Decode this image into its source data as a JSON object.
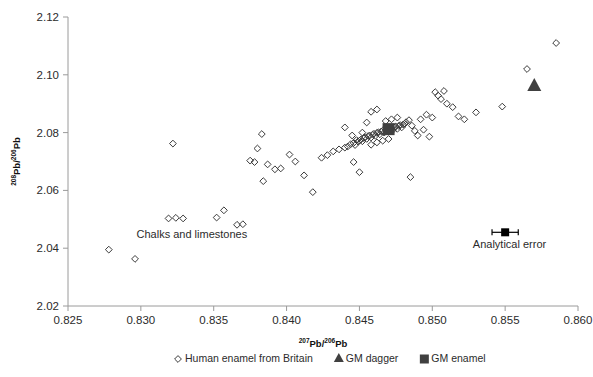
{
  "chart_data": {
    "type": "scatter",
    "title": "",
    "xlabel": "207Pb/206Pb",
    "ylabel": "208Pb/206Pb",
    "xlabel_parts": {
      "sup": "207",
      "base": "Pb/",
      "sup2": "206",
      "base2": "Pb"
    },
    "ylabel_parts": {
      "sup": "208",
      "base": "Pb/",
      "sup2": "206",
      "base2": "Pb"
    },
    "xlim": [
      0.825,
      0.86
    ],
    "ylim": [
      2.02,
      2.12
    ],
    "xticks": [
      "0.825",
      "0.830",
      "0.835",
      "0.840",
      "0.845",
      "0.850",
      "0.855",
      "0.860"
    ],
    "yticks": [
      "2.02",
      "2.04",
      "2.06",
      "2.08",
      "2.10",
      "2.12"
    ],
    "grid": false,
    "legend_position": "bottom",
    "series": [
      {
        "name": "Human enamel from Britain",
        "marker": "open-diamond",
        "color": "#3a3a3a",
        "points": [
          [
            0.8278,
            2.0395
          ],
          [
            0.8296,
            2.0363
          ],
          [
            0.8319,
            2.0503
          ],
          [
            0.8324,
            2.0505
          ],
          [
            0.8329,
            2.0503
          ],
          [
            0.8322,
            2.0762
          ],
          [
            0.8352,
            2.0506
          ],
          [
            0.8357,
            2.0531
          ],
          [
            0.8366,
            2.0481
          ],
          [
            0.837,
            2.0483
          ],
          [
            0.8375,
            2.0703
          ],
          [
            0.8378,
            2.0698
          ],
          [
            0.838,
            2.0745
          ],
          [
            0.8383,
            2.0795
          ],
          [
            0.8384,
            2.0632
          ],
          [
            0.8387,
            2.069
          ],
          [
            0.8392,
            2.0673
          ],
          [
            0.8396,
            2.0676
          ],
          [
            0.8402,
            2.0724
          ],
          [
            0.8406,
            2.07
          ],
          [
            0.8412,
            2.0652
          ],
          [
            0.8418,
            2.0594
          ],
          [
            0.8424,
            2.0713
          ],
          [
            0.8428,
            2.0722
          ],
          [
            0.8432,
            2.0735
          ],
          [
            0.8436,
            2.0742
          ],
          [
            0.844,
            2.0748
          ],
          [
            0.8442,
            2.0752
          ],
          [
            0.8444,
            2.076
          ],
          [
            0.8446,
            2.0764
          ],
          [
            0.8447,
            2.0757
          ],
          [
            0.8449,
            2.0769
          ],
          [
            0.845,
            2.0772
          ],
          [
            0.8451,
            2.0776
          ],
          [
            0.8452,
            2.077
          ],
          [
            0.8453,
            2.0781
          ],
          [
            0.8454,
            2.0784
          ],
          [
            0.8455,
            2.0778
          ],
          [
            0.8456,
            2.0788
          ],
          [
            0.8457,
            2.079
          ],
          [
            0.8458,
            2.0783
          ],
          [
            0.8459,
            2.0793
          ],
          [
            0.846,
            2.0796
          ],
          [
            0.8461,
            2.0789
          ],
          [
            0.8462,
            2.0799
          ],
          [
            0.8463,
            2.0801
          ],
          [
            0.8464,
            2.0794
          ],
          [
            0.8465,
            2.0804
          ],
          [
            0.8466,
            2.0807
          ],
          [
            0.8467,
            2.08
          ],
          [
            0.8468,
            2.081
          ],
          [
            0.8469,
            2.0812
          ],
          [
            0.847,
            2.0805
          ],
          [
            0.8471,
            2.0814
          ],
          [
            0.8472,
            2.0817
          ],
          [
            0.8473,
            2.0809
          ],
          [
            0.8474,
            2.0819
          ],
          [
            0.8475,
            2.0821
          ],
          [
            0.8476,
            2.0813
          ],
          [
            0.8477,
            2.0823
          ],
          [
            0.8478,
            2.0826
          ],
          [
            0.8479,
            2.0818
          ],
          [
            0.848,
            2.0828
          ],
          [
            0.8481,
            2.083
          ],
          [
            0.8445,
            2.079
          ],
          [
            0.8448,
            2.0774
          ],
          [
            0.8458,
            2.0758
          ],
          [
            0.8462,
            2.0766
          ],
          [
            0.8466,
            2.0772
          ],
          [
            0.847,
            2.0778
          ],
          [
            0.844,
            2.0818
          ],
          [
            0.8452,
            2.08
          ],
          [
            0.8455,
            2.0835
          ],
          [
            0.8468,
            2.084
          ],
          [
            0.8472,
            2.0846
          ],
          [
            0.8476,
            2.0852
          ],
          [
            0.8458,
            2.0872
          ],
          [
            0.8462,
            2.088
          ],
          [
            0.845,
            2.0663
          ],
          [
            0.8446,
            2.0698
          ],
          [
            0.8482,
            2.0836
          ],
          [
            0.8484,
            2.0843
          ],
          [
            0.8486,
            2.0824
          ],
          [
            0.8488,
            2.0806
          ],
          [
            0.849,
            2.079
          ],
          [
            0.8492,
            2.0846
          ],
          [
            0.8494,
            2.081
          ],
          [
            0.8496,
            2.0862
          ],
          [
            0.8498,
            2.0786
          ],
          [
            0.85,
            2.0852
          ],
          [
            0.8502,
            2.094
          ],
          [
            0.8504,
            2.0928
          ],
          [
            0.8506,
            2.0916
          ],
          [
            0.8508,
            2.0944
          ],
          [
            0.851,
            2.09
          ],
          [
            0.8514,
            2.0888
          ],
          [
            0.8518,
            2.0856
          ],
          [
            0.8522,
            2.0846
          ],
          [
            0.8485,
            2.0646
          ],
          [
            0.853,
            2.087
          ],
          [
            0.8548,
            2.089
          ],
          [
            0.8565,
            2.102
          ],
          [
            0.8585,
            2.111
          ]
        ]
      },
      {
        "name": "GM dagger",
        "marker": "filled-triangle",
        "color": "#4a4a4a",
        "points": [
          [
            0.857,
            2.0965
          ]
        ]
      },
      {
        "name": "GM enamel",
        "marker": "filled-square",
        "color": "#4a4a4a",
        "points": [
          [
            0.847,
            2.0812
          ]
        ]
      }
    ],
    "annotations": [
      {
        "name": "chalks-and-limestones",
        "text": "Chalks and limestones",
        "x": 0.8335,
        "y": 2.0437
      },
      {
        "name": "analytical-error",
        "text": "Analytical error",
        "x": 0.8553,
        "y": 2.0402
      }
    ],
    "error_marker": {
      "x": 0.855,
      "y": 2.0455,
      "x_err": 0.0009
    }
  },
  "legend": {
    "items": [
      {
        "label": "Human enamel from Britain",
        "marker": "open-diamond"
      },
      {
        "label": "GM dagger",
        "marker": "filled-triangle"
      },
      {
        "label": "GM enamel",
        "marker": "filled-square"
      }
    ]
  }
}
